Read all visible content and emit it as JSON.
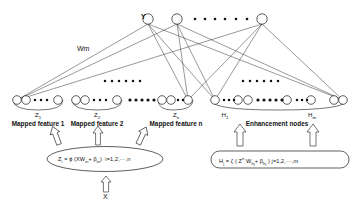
{
  "diagram": {
    "output_layer": {
      "label": "Y",
      "nodes": 3,
      "ellipsis_dots": 7
    },
    "weight_label": "Wm",
    "input_label": "X",
    "feature_groups": [
      {
        "name": "Mapped feature 1",
        "sub": "Z",
        "sub_index": "1"
      },
      {
        "name": "Mapped feature 2",
        "sub": "Z",
        "sub_index": "2"
      },
      {
        "name": "Mapped feature  n",
        "sub": "Z",
        "sub_index": "n"
      }
    ],
    "group_gap_dots": 6,
    "enhancement": {
      "name": "Enhancement nodes",
      "sub_first": "H",
      "sub_first_index": "1",
      "sub_last": "H",
      "sub_last_index": "m"
    },
    "formulas": {
      "mapped": {
        "lhs": "Z",
        "lhs_sub": "i",
        "eq": " = ϕ (XW",
        "w_sub": "ei",
        "plus": "+ β",
        "b_sub": "ei",
        "close": ")",
        "range": "i=1,2,···,n",
        "full": "Zᵢ = ϕ (XWₑᵢ + βₑᵢ)  i=1,2,···,n"
      },
      "enhancement": {
        "lhs": "H",
        "lhs_sub": "j",
        "eq": " = ζ ( Z",
        "z_sup": "n",
        "w": " W",
        "w_sub": "hj",
        "plus": "+ β",
        "b_sub": "hj",
        "close": " )",
        "range": "j=1,2,···,m",
        "full": "Hⱼ = ζ ( Zⁿ Wₕⱼ + βₕⱼ )  j=1,2,···,m"
      }
    },
    "colors": {
      "stroke": "#1a1a1a",
      "fill": "#ffffff",
      "dot": "#111111",
      "background": "#ffffff"
    }
  }
}
